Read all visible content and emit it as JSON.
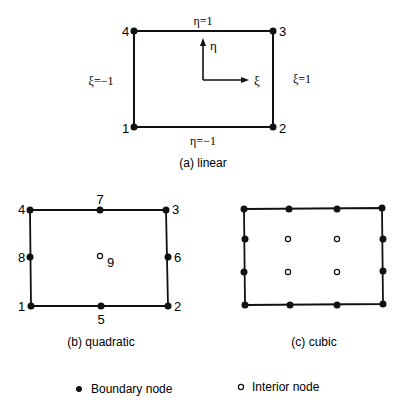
{
  "linear": {
    "caption": "(a) linear",
    "nodes": [
      {
        "label": "1",
        "x": 134,
        "y": 127
      },
      {
        "label": "2",
        "x": 273,
        "y": 127
      },
      {
        "label": "3",
        "x": 273,
        "y": 31
      },
      {
        "label": "4",
        "x": 134,
        "y": 31
      }
    ],
    "edge_labels": {
      "top": "η=1",
      "bottom": "η=−1",
      "left": "ξ=−1",
      "right": "ξ=1"
    },
    "axes": {
      "eta": "η",
      "xi": "ξ"
    }
  },
  "quadratic": {
    "caption": "(b) quadratic",
    "boundary_nodes": [
      {
        "label": "1",
        "x": 31,
        "y": 306
      },
      {
        "label": "2",
        "x": 168,
        "y": 306
      },
      {
        "label": "3",
        "x": 166,
        "y": 210
      },
      {
        "label": "4",
        "x": 30,
        "y": 210
      },
      {
        "label": "5",
        "x": 101,
        "y": 306
      },
      {
        "label": "6",
        "x": 168,
        "y": 257
      },
      {
        "label": "7",
        "x": 100,
        "y": 210
      },
      {
        "label": "8",
        "x": 30,
        "y": 257
      }
    ],
    "interior_nodes": [
      {
        "label": "9",
        "x": 100,
        "y": 256
      }
    ]
  },
  "cubic": {
    "caption": "(c) cubic",
    "boundary_nodes": [
      {
        "x": 244,
        "y": 209
      },
      {
        "x": 289,
        "y": 209
      },
      {
        "x": 337,
        "y": 209
      },
      {
        "x": 382,
        "y": 208
      },
      {
        "x": 245,
        "y": 239
      },
      {
        "x": 383,
        "y": 239
      },
      {
        "x": 244,
        "y": 272
      },
      {
        "x": 383,
        "y": 271
      },
      {
        "x": 245,
        "y": 305
      },
      {
        "x": 290,
        "y": 305
      },
      {
        "x": 337,
        "y": 305
      },
      {
        "x": 383,
        "y": 304
      }
    ],
    "interior_nodes": [
      {
        "x": 288,
        "y": 239
      },
      {
        "x": 337,
        "y": 239
      },
      {
        "x": 288,
        "y": 272
      },
      {
        "x": 337,
        "y": 272
      }
    ]
  },
  "legend": {
    "boundary": "Boundary node",
    "interior": "Interior node"
  }
}
